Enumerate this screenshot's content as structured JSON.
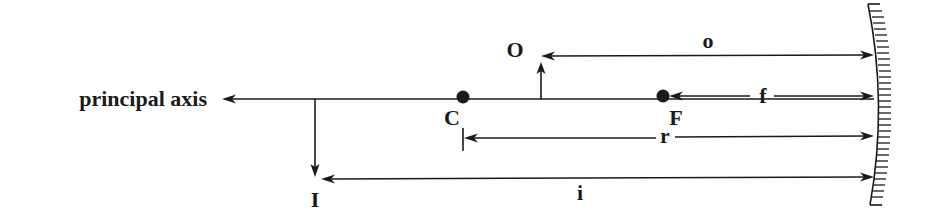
{
  "diagram": {
    "colors": {
      "ink": "#1a1a1a",
      "background": "#ffffff"
    },
    "principal_axis": {
      "label": "principal axis"
    },
    "points": {
      "center_of_curvature": {
        "label": "C"
      },
      "focal_point": {
        "label": "F"
      }
    },
    "object": {
      "label": "O"
    },
    "image": {
      "label": "I"
    },
    "dimensions": {
      "object_distance": {
        "label": "o"
      },
      "focal_length": {
        "label": "f"
      },
      "radius_of_curvature": {
        "label": "r"
      },
      "image_distance": {
        "label": "i"
      }
    },
    "mirror": {
      "type": "concave-mirror"
    }
  }
}
